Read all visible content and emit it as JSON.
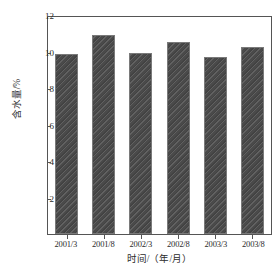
{
  "chart_data": {
    "type": "bar",
    "title": "",
    "subtitle": "",
    "xlabel": "时间/（年/月）",
    "ylabel": "含水量/%",
    "categories": [
      "2001/3",
      "2001/8",
      "2002/3",
      "2002/8",
      "2003/3",
      "2003/8"
    ],
    "values": [
      9.84,
      10.88,
      9.92,
      10.54,
      9.68,
      10.23
    ],
    "ylim": [
      0,
      12
    ],
    "yticks": [
      0,
      2,
      4,
      6,
      8,
      10,
      12
    ],
    "ytick_labels": [
      "",
      "2",
      "4",
      "6",
      "8",
      "10",
      "12"
    ],
    "grid": false,
    "legend": null,
    "series": [
      {
        "name": "含水量",
        "values": [
          9.84,
          10.88,
          9.92,
          10.54,
          9.68,
          10.23
        ],
        "color": "#4a4a4a",
        "hatch": "diagonal-stripes"
      }
    ],
    "colors": {
      "bar_fill": "#4a4a4a",
      "bar_edge": "#7a7a7a",
      "axis": "#555555",
      "text": "#2b2b2b",
      "background": "#ffffff"
    }
  }
}
